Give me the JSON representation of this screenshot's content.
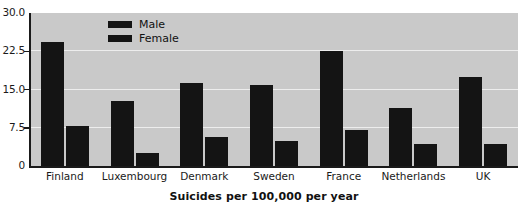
{
  "chart_data": {
    "type": "bar",
    "title": "",
    "xlabel": "Suicides per 100,000 per year",
    "ylabel": "",
    "categories": [
      "Finland",
      "Luxembourg",
      "Denmark",
      "Sweden",
      "France",
      "Netherlands",
      "UK"
    ],
    "series": [
      {
        "name": "Male",
        "color": "#141414",
        "values": [
          24.3,
          12.8,
          16.3,
          15.8,
          22.6,
          11.4,
          17.5
        ]
      },
      {
        "name": "Female",
        "color": "#141414",
        "values": [
          7.9,
          2.5,
          5.7,
          5.0,
          7.0,
          4.3,
          4.4
        ]
      }
    ],
    "ylim": [
      0,
      30
    ],
    "yticks": [
      30.0,
      22.5,
      15.0,
      7.5,
      0
    ],
    "ytick_labels": [
      "30.0",
      "22.5",
      "15.0",
      "7.5",
      "0"
    ],
    "grid": true,
    "gridlines_at": [
      22.5,
      15.0,
      7.5
    ],
    "legend_position": "top-left-inside",
    "plot_background": "#c9c9c9",
    "gridline_color": "#ededed",
    "axis_color": "#1a1a1a",
    "figure_background": "#ffffff"
  }
}
